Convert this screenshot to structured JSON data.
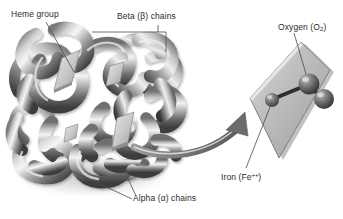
{
  "figure": {
    "background_color": "#ffffff",
    "width": 343,
    "height": 219
  },
  "labels": {
    "heme_group": "Heme group",
    "beta_chains_pre": "Beta (",
    "beta_symbol": "β",
    "beta_chains_post": ") chains",
    "alpha_chains_pre": "Alpha (",
    "alpha_symbol": "α",
    "alpha_chains_post": ") chains",
    "oxygen_pre": "Oxygen (O",
    "oxygen_sub": "2",
    "oxygen_post": ")",
    "iron_pre": "Iron (Fe",
    "iron_sup": "++",
    "iron_post": ")"
  },
  "colors": {
    "text": "#2b2b2b",
    "leader_line": "#4a4a4a",
    "protein_light": "#f2f2f2",
    "protein_mid": "#9a9a9a",
    "protein_dark": "#4a4a4a",
    "heme_plate": "#d8d8d8",
    "heme_plate_edge": "#8c8c8c",
    "inset_plane_fill": "#bdbdbd",
    "inset_plane_edge": "#777777",
    "sphere_dark": "#4f4f4f",
    "sphere_mid": "#6f6f6f",
    "sphere_highlight": "#c9c9c9",
    "arrow": "#6b6b6b",
    "shadow": "#cfcfcf"
  },
  "icons": {
    "leader_heme": "leader-line-icon",
    "leader_beta": "bracket-leader-icon",
    "leader_alpha": "leader-line-icon",
    "leader_oxygen": "leader-line-icon",
    "leader_iron": "leader-line-icon",
    "callout_arrow": "curved-arrow-icon"
  },
  "inset": {
    "plane_name": "heme-plane",
    "iron_atom": "iron-atom-sphere",
    "oxygen_atom_1": "oxygen-atom-sphere-upper",
    "oxygen_atom_2": "oxygen-atom-sphere-lower",
    "bond": "iron-oxygen-bond"
  },
  "structure": {
    "chain_count": 4,
    "heme_plate_count": 4
  }
}
